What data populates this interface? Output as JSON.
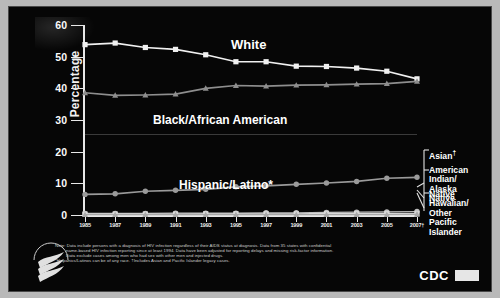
{
  "chart_data": {
    "type": "line",
    "title": "",
    "xlabel": "",
    "ylabel": "Percentage",
    "ylim": [
      0,
      60
    ],
    "yticks": [
      0,
      10,
      20,
      30,
      40,
      50,
      60
    ],
    "categories": [
      "1985",
      "1987",
      "1989",
      "1991",
      "1993",
      "1995",
      "1997",
      "1999",
      "2001",
      "2003",
      "2005",
      "2007"
    ],
    "xtick_labels": [
      "1985",
      "1987",
      "1989",
      "1991",
      "1993",
      "1995",
      "1997",
      "1999",
      "2001",
      "2003",
      "2005",
      "2007†"
    ],
    "grid": false,
    "legend": "inline-labels",
    "series": [
      {
        "name": "White",
        "marker": "square",
        "color": "#f0f0f0",
        "values": [
          53.8,
          54.3,
          52.9,
          52.3,
          50.6,
          48.4,
          48.4,
          47.0,
          46.9,
          46.4,
          45.4,
          43.0
        ]
      },
      {
        "name": "Black/African American",
        "marker": "triangle",
        "color": "#8e8e8e",
        "values": [
          38.6,
          37.8,
          37.9,
          38.2,
          40.0,
          40.9,
          40.7,
          41.0,
          41.1,
          41.3,
          41.5,
          42.2
        ]
      },
      {
        "name": "Hispanic/Latino*",
        "marker": "circle",
        "color": "#9a9a9a",
        "values": [
          6.5,
          6.7,
          7.5,
          7.8,
          8.1,
          8.9,
          9.2,
          9.7,
          10.1,
          10.6,
          11.6,
          11.9
        ]
      },
      {
        "name": "Asian†",
        "marker": "circle",
        "color": "#bdbdbd",
        "values": [
          0.5,
          0.5,
          0.5,
          0.6,
          0.6,
          0.6,
          0.7,
          0.7,
          0.8,
          0.9,
          1.0,
          1.1
        ]
      },
      {
        "name": "American Indian/Alaska Native",
        "marker": "square",
        "color": "#d8d8d8",
        "values": [
          0.3,
          0.3,
          0.3,
          0.3,
          0.4,
          0.4,
          0.4,
          0.4,
          0.5,
          0.5,
          0.5,
          0.5
        ]
      },
      {
        "name": "Native Hawaiian/Other Pacific Islander",
        "marker": "triangle",
        "color": "#a8a8a8",
        "values": [
          0.1,
          0.1,
          0.1,
          0.1,
          0.1,
          0.1,
          0.1,
          0.1,
          0.1,
          0.1,
          0.1,
          0.2
        ]
      }
    ]
  },
  "axis": {
    "y_label": "Percentage"
  },
  "labels": {
    "white": "White",
    "black": "Black/African American",
    "hispanic": "Hispanic/Latino*"
  },
  "callouts": {
    "asian": "Asian",
    "asian_sup": "†",
    "american_indian_l1": "American Indian/",
    "american_indian_l2": "Alaska Native",
    "nhopi_l1": "Native Hawaiian/",
    "nhopi_l2": "Other Pacific",
    "nhopi_l3": "Islander"
  },
  "footnote": {
    "line1": "Note: Data include persons with a diagnosis of HIV infection regardless of their AIDS status at diagnosis. Data from 35 states with confidential",
    "line2": "name-based HIV infection reporting since at least 1994. Data have been adjusted for reporting delays and missing risk-factor information.",
    "line3": "Data exclude cases among men who had sex with other men and injected drugs.",
    "line4": "*Hispanics/Latinos can be of any race.",
    "line5": "†Includes Asian and Pacific Islander legacy cases."
  },
  "branding": {
    "cdc": "CDC"
  }
}
